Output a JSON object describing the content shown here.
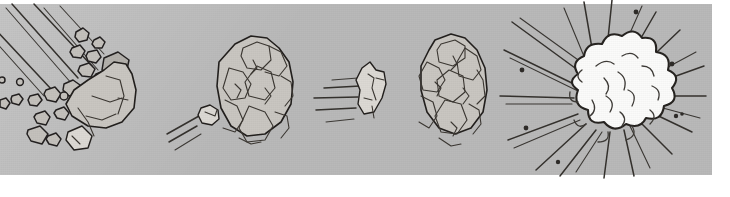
{
  "artwork": {
    "title": "Asteroid Impact Sequence",
    "medium": "hand-drawn pencil and ink sketch on gray paper",
    "caption": "Five-stage comic strip: shattering debris, intact asteroid, small fast fragment, second asteroid, and final explosion burst",
    "canvas": {
      "width": 730,
      "height": 197
    },
    "paper": {
      "x": 0,
      "y": 4,
      "width": 712,
      "height": 171,
      "background_color": "#b9b9b9",
      "border_color": "#ffffff"
    },
    "ink_color": "#2a2724",
    "rock_fill_color": "#c9c6c1",
    "rock_highlight_color": "#dcd9d4",
    "explosion_fill_color": "#fbfbfa"
  },
  "panels": [
    {
      "id": "panel-1",
      "name": "shattering-debris",
      "label": "Shattering debris with incoming streaks",
      "x": 0,
      "y": 0,
      "width": 165,
      "height": 197,
      "elements": [
        "streak-lines",
        "debris-chips",
        "main-fragment"
      ],
      "streak_count": 6,
      "chip_count": 22
    },
    {
      "id": "panel-2",
      "name": "asteroid-large-a",
      "label": "Large intact asteroid with small trailing fragment",
      "x": 165,
      "y": 0,
      "width": 145,
      "height": 197,
      "elements": [
        "small-fragment",
        "speed-lines",
        "asteroid-body"
      ],
      "speed_line_count": 3
    },
    {
      "id": "panel-3",
      "name": "fragment-in-flight",
      "label": "Small fragment flying with horizontal speed lines",
      "x": 310,
      "y": 0,
      "width": 85,
      "height": 197,
      "elements": [
        "speed-lines",
        "fragment-body"
      ],
      "speed_line_count": 5
    },
    {
      "id": "panel-4",
      "name": "asteroid-large-b",
      "label": "Second large asteroid, cracked surface",
      "x": 395,
      "y": 0,
      "width": 105,
      "height": 197,
      "elements": [
        "asteroid-body",
        "crack-facets"
      ]
    },
    {
      "id": "panel-5",
      "name": "explosion-burst",
      "label": "White explosion cloud with radiating impact rays",
      "x": 500,
      "y": 0,
      "width": 230,
      "height": 197,
      "elements": [
        "radiating-rays",
        "explosion-cloud",
        "flying-specks"
      ],
      "ray_count": 26,
      "speck_count": 7
    }
  ]
}
